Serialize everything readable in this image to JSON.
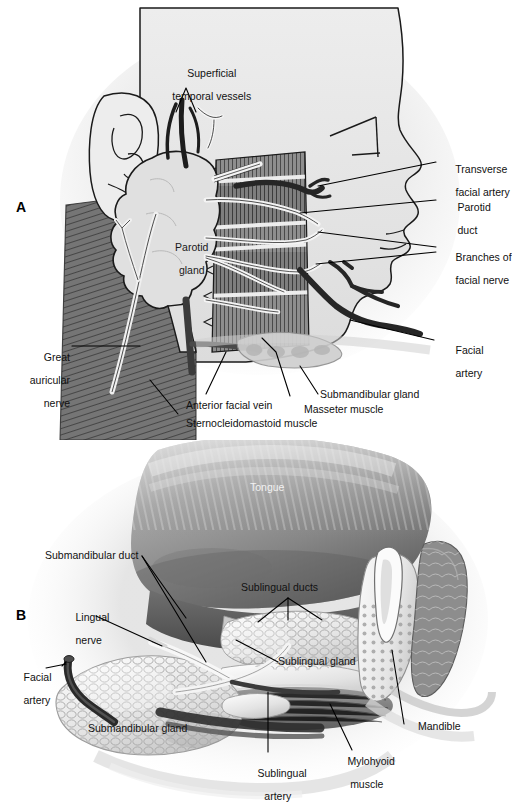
{
  "figure": {
    "background_color": "#ffffff",
    "style": "grayscale anatomical illustration",
    "panels": [
      {
        "id": "A",
        "letter": "A",
        "caption_view": "Lateral view of face showing parotid gland and related structures",
        "labels": [
          {
            "id": "superficial-temporal-vessels",
            "text": "Superficial\ntemporal vessels",
            "line1": "Superficial",
            "line2": "temporal vessels"
          },
          {
            "id": "transverse-facial-artery",
            "text": "Transverse\nfacial artery",
            "line1": "Transverse",
            "line2": "facial artery"
          },
          {
            "id": "parotid-duct",
            "text": "Parotid\nduct",
            "line1": "Parotid",
            "line2": "duct"
          },
          {
            "id": "branches-of-facial-nerve",
            "text": "Branches of\nfacial nerve",
            "line1": "Branches of",
            "line2": "facial nerve"
          },
          {
            "id": "facial-artery",
            "text": "Facial\nartery",
            "line1": "Facial",
            "line2": "artery"
          },
          {
            "id": "parotid-gland",
            "text": "Parotid\ngland",
            "line1": "Parotid",
            "line2": "gland"
          },
          {
            "id": "great-auricular-nerve",
            "text": "Great\nauricular\nnerve",
            "line1": "Great",
            "line2": "auricular",
            "line3": "nerve"
          },
          {
            "id": "submandibular-gland",
            "text": "Submandibular gland",
            "line1": "Submandibular gland"
          },
          {
            "id": "masseter-muscle",
            "text": "Masseter muscle",
            "line1": "Masseter muscle"
          },
          {
            "id": "anterior-facial-vein",
            "text": "Anterior facial vein",
            "line1": "Anterior facial vein"
          },
          {
            "id": "sternocleidomastoid-muscle",
            "text": "Sternocleidomastoid muscle",
            "line1": "Sternocleidomastoid muscle"
          }
        ]
      },
      {
        "id": "B",
        "letter": "B",
        "caption_view": "Floor of mouth with tongue retracted showing submandibular and sublingual glands",
        "labels": [
          {
            "id": "tongue",
            "text": "Tongue",
            "line1": "Tongue"
          },
          {
            "id": "submandibular-duct",
            "text": "Submandibular duct",
            "line1": "Submandibular duct"
          },
          {
            "id": "sublingual-ducts",
            "text": "Sublingual ducts",
            "line1": "Sublingual ducts"
          },
          {
            "id": "lingual-nerve",
            "text": "Lingual\nnerve",
            "line1": "Lingual",
            "line2": "nerve"
          },
          {
            "id": "sublingual-gland",
            "text": "Sublingual gland",
            "line1": "Sublingual gland"
          },
          {
            "id": "facial-artery",
            "text": "Facial\nartery",
            "line1": "Facial",
            "line2": "artery"
          },
          {
            "id": "submandibular-gland",
            "text": "Submandibular gland",
            "line1": "Submandibular gland"
          },
          {
            "id": "mandible",
            "text": "Mandible",
            "line1": "Mandible"
          },
          {
            "id": "mylohyoid-muscle",
            "text": "Mylohyoid\nmuscle",
            "line1": "Mylohyoid",
            "line2": "muscle"
          },
          {
            "id": "sublingual-artery",
            "text": "Sublingual\nartery",
            "line1": "Sublingual",
            "line2": "artery"
          }
        ]
      }
    ],
    "colors": {
      "background": "#ffffff",
      "ink": "#000000",
      "label_text": "#111111",
      "faded_text": "#9a9a9a",
      "skin_light": "#e6e6e6",
      "skin_shadow": "#d2d2d2",
      "gland_fill": "#dcdcdc",
      "muscle_dark": "#6e6e6e",
      "muscle_mid": "#8a8a8a",
      "vessel_dark": "#2b2b2b",
      "nerve_light": "#f4f4f4",
      "tongue_mid": "#9b9b9b",
      "tongue_dark": "#6a6a6a",
      "bone_light": "#efefef"
    }
  }
}
